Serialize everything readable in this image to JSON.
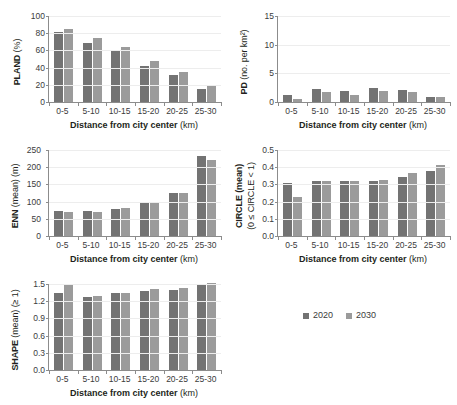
{
  "figure": {
    "background": "#ffffff",
    "series_colors": [
      "#737373",
      "#9b9b9b"
    ],
    "axis_color": "#8c8c8c",
    "gridline_color": "#ededed"
  },
  "legend": {
    "position": "bottom-right",
    "items": [
      {
        "label": "2020",
        "color": "#737373"
      },
      {
        "label": "2030",
        "color": "#9b9b9b"
      }
    ]
  },
  "common": {
    "xlabel_bold": "Distance from city center",
    "xlabel_unit": "(km)",
    "categories": [
      "0-5",
      "5-10",
      "10-15",
      "15-20",
      "20-25",
      "25-30"
    ]
  },
  "chart_data": [
    {
      "id": "pland",
      "type": "bar",
      "title": "",
      "ylabel": "PLAND (%)",
      "ylabel_bold": "PLAND",
      "ylabel_light": "(%)",
      "xlabel": "Distance from city center (km)",
      "categories": [
        "0-5",
        "5-10",
        "10-15",
        "15-20",
        "20-25",
        "25-30"
      ],
      "ylim": [
        0,
        100
      ],
      "yticks": [
        0,
        20,
        40,
        60,
        80,
        100
      ],
      "ytick_labels": [
        "0",
        "20",
        "40",
        "60",
        "80",
        "100"
      ],
      "grid": true,
      "legend_position": "none",
      "series": [
        {
          "name": "2020",
          "color": "#737373",
          "values": [
            81.2,
            69.0,
            58.8,
            42.3,
            31.4,
            15.6
          ]
        },
        {
          "name": "2030",
          "color": "#9b9b9b",
          "values": [
            84.6,
            74.4,
            64.2,
            47.2,
            34.8,
            18.4
          ]
        }
      ]
    },
    {
      "id": "pd",
      "type": "bar",
      "title": "",
      "ylabel": "PD (no. per km2)",
      "ylabel_bold": "PD",
      "ylabel_light": "(no. per km²)",
      "xlabel": "Distance from city center (km)",
      "categories": [
        "0-5",
        "5-10",
        "10-15",
        "15-20",
        "20-25",
        "25-30"
      ],
      "ylim": [
        0,
        15
      ],
      "yticks": [
        0,
        5,
        10,
        15
      ],
      "ytick_labels": [
        "0",
        "5",
        "10",
        "15"
      ],
      "grid": true,
      "legend_position": "none",
      "series": [
        {
          "name": "2020",
          "color": "#737373",
          "values": [
            1.15,
            2.35,
            1.95,
            2.4,
            2.1,
            0.9
          ]
        },
        {
          "name": "2030",
          "color": "#9b9b9b",
          "values": [
            0.6,
            1.7,
            1.25,
            1.9,
            1.7,
            0.8
          ]
        }
      ]
    },
    {
      "id": "enn",
      "type": "bar",
      "title": "",
      "ylabel": "ENN (mean) (m)",
      "ylabel_bold": "ENN",
      "ylabel_light": "(mean) (m)",
      "xlabel": "Distance from city center (km)",
      "categories": [
        "0-5",
        "5-10",
        "10-15",
        "15-20",
        "20-25",
        "25-30"
      ],
      "ylim": [
        0,
        250
      ],
      "yticks": [
        0,
        50,
        100,
        150,
        200,
        250
      ],
      "ytick_labels": [
        "0",
        "50",
        "100",
        "150",
        "200",
        "250"
      ],
      "grid": true,
      "legend_position": "none",
      "series": [
        {
          "name": "2020",
          "color": "#737373",
          "values": [
            72,
            73,
            78,
            96,
            124,
            232
          ]
        },
        {
          "name": "2030",
          "color": "#9b9b9b",
          "values": [
            70,
            71,
            80,
            99,
            124,
            222
          ]
        }
      ]
    },
    {
      "id": "circle",
      "type": "bar",
      "title": "",
      "ylabel": "CIRCLE (mean) (0 ≤ CIRCLE < 1)",
      "ylabel_bold": "CIRCLE (mean)",
      "ylabel_light": "(0 ≤ CIRCLE < 1)",
      "xlabel": "Distance from city center (km)",
      "categories": [
        "0-5",
        "5-10",
        "10-15",
        "15-20",
        "20-25",
        "25-30"
      ],
      "ylim": [
        0,
        0.5
      ],
      "yticks": [
        0,
        0.1,
        0.2,
        0.3,
        0.4,
        0.5
      ],
      "ytick_labels": [
        "0.0",
        "0.1",
        "0.2",
        "0.3",
        "0.4",
        "0.5"
      ],
      "grid": true,
      "legend_position": "none",
      "series": [
        {
          "name": "2020",
          "color": "#737373",
          "values": [
            0.307,
            0.32,
            0.318,
            0.318,
            0.345,
            0.377
          ]
        },
        {
          "name": "2030",
          "color": "#9b9b9b",
          "values": [
            0.225,
            0.321,
            0.318,
            0.328,
            0.367,
            0.414
          ]
        }
      ]
    },
    {
      "id": "shape",
      "type": "bar",
      "title": "",
      "ylabel": "SHAPE (mean) (≥ 1)",
      "ylabel_bold": "SHAPE",
      "ylabel_light": "(mean) (≥ 1)",
      "xlabel": "Distance from city center (km)",
      "categories": [
        "0-5",
        "5-10",
        "10-15",
        "15-20",
        "20-25",
        "25-30"
      ],
      "ylim": [
        0,
        1.5
      ],
      "yticks": [
        0,
        0.3,
        0.6,
        0.9,
        1.2,
        1.5
      ],
      "ytick_labels": [
        "0.0",
        "0.3",
        "0.6",
        "0.9",
        "1.2",
        "1.5"
      ],
      "grid": true,
      "legend_position": "none",
      "series": [
        {
          "name": "2020",
          "color": "#737373",
          "values": [
            1.335,
            1.265,
            1.34,
            1.385,
            1.39,
            1.485
          ]
        },
        {
          "name": "2030",
          "color": "#9b9b9b",
          "values": [
            1.49,
            1.285,
            1.35,
            1.405,
            1.435,
            1.52
          ]
        }
      ]
    }
  ]
}
